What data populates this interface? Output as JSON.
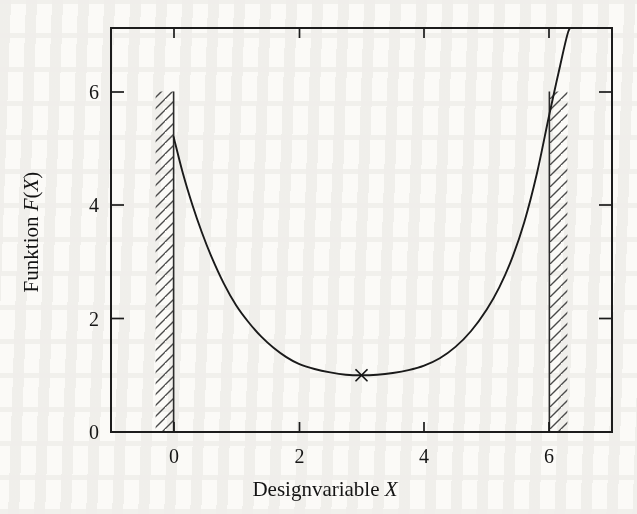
{
  "figure": {
    "background_color": "#fbfaf7",
    "ink_color": "#1a1a1a",
    "width": 637,
    "height": 514
  },
  "axes": {
    "x_title_plain": "Designvariable",
    "x_title_italic": "X",
    "y_title_plain": "Funktion",
    "y_title_italic_prefix": "F",
    "y_title_italic_suffix": "X",
    "y_title_full": "Funktion F(X)",
    "x_title_full": "Designvariable X",
    "x_ticks": [
      "0",
      "2",
      "4",
      "6"
    ],
    "y_ticks": [
      "0",
      "2",
      "4",
      "6"
    ]
  },
  "chart_data": {
    "type": "line",
    "title": "",
    "xlabel": "Designvariable X",
    "ylabel": "Funktion F(X)",
    "xlim": [
      -1.0,
      7.0
    ],
    "ylim": [
      0.0,
      7.12
    ],
    "xticks": [
      0,
      2,
      4,
      6
    ],
    "yticks": [
      0,
      2,
      4,
      6
    ],
    "grid": false,
    "legend": null,
    "series": [
      {
        "name": "F(X)",
        "kind": "line",
        "x": [
          0.0,
          0.15,
          0.3,
          0.45,
          0.6,
          0.8,
          1.0,
          1.2,
          1.4,
          1.6,
          1.8,
          2.0,
          2.25,
          2.5,
          2.75,
          3.0,
          3.25,
          3.5,
          3.75,
          4.0,
          4.25,
          4.5,
          4.75,
          5.0,
          5.2,
          5.4,
          5.6,
          5.8,
          6.0,
          6.15,
          6.3,
          6.38
        ],
        "y": [
          5.2,
          4.55,
          4.0,
          3.52,
          3.1,
          2.62,
          2.23,
          1.93,
          1.68,
          1.48,
          1.32,
          1.2,
          1.11,
          1.05,
          1.01,
          1.0,
          1.01,
          1.04,
          1.09,
          1.17,
          1.3,
          1.5,
          1.78,
          2.16,
          2.55,
          3.05,
          3.7,
          4.55,
          5.6,
          6.35,
          7.05,
          7.12
        ]
      }
    ],
    "markers": [
      {
        "name": "optimum",
        "symbol": "x",
        "x": 3.0,
        "y": 1.0
      }
    ],
    "constraints": [
      {
        "name": "lower-bound",
        "x": 0.0,
        "y_from": 0.0,
        "y_to": 6.0,
        "hatch_side": "left",
        "label": ""
      },
      {
        "name": "upper-bound",
        "x": 6.0,
        "y_from": 0.0,
        "y_to": 6.0,
        "hatch_side": "right",
        "label": ""
      }
    ]
  }
}
